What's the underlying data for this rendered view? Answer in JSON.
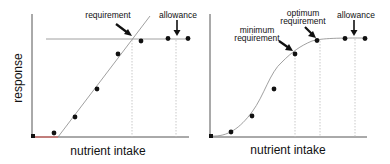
{
  "left_panel": {
    "y_axis_label": "response",
    "x_axis_label": "nutrient intake",
    "annotations": {
      "requirement": "requirement",
      "allowance": "allowance"
    },
    "model": "linear broken-line (plateau)"
  },
  "right_panel": {
    "x_axis_label": "nutrient intake",
    "annotations": {
      "minimum_requirement_line1": "minimum",
      "minimum_requirement_line2": "requirement",
      "optimum_requirement_line1": "optimum",
      "optimum_requirement_line2": "requirement",
      "allowance": "allowance"
    },
    "model": "sigmoidal curve (plateau)"
  },
  "colors": {
    "line": "#777777",
    "axis": "#555555",
    "points": "#111111",
    "guide": "#bbbbbb",
    "baseline_accent": "#d9534f"
  }
}
